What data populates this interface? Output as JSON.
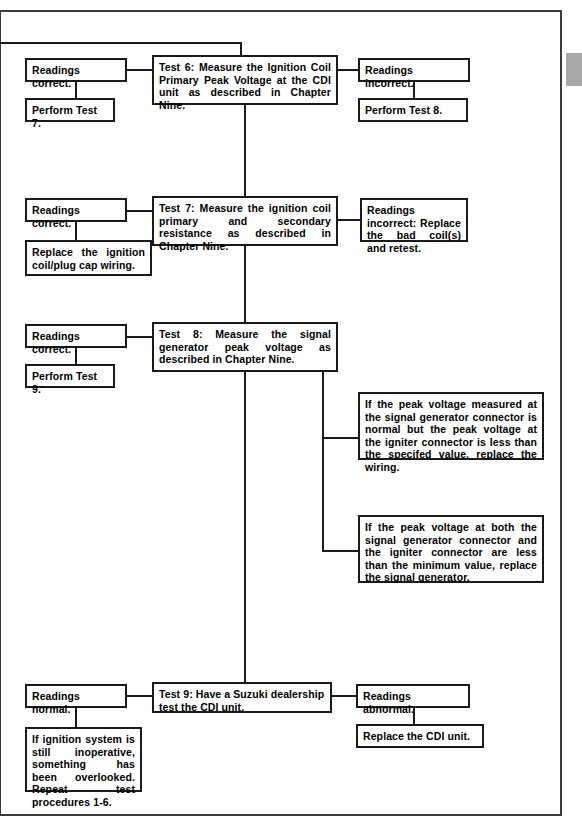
{
  "document": {
    "type": "flow-chart",
    "subject": "Ignition system troubleshooting, tests 6 through 9"
  },
  "nodes": {
    "test6": {
      "label": "Test 6: Measure the Ignition Coil Primary Peak Voltage at the CDI unit as described in Chapter Nine."
    },
    "test6_left_result": {
      "label": "Readings correct."
    },
    "test6_left_action": {
      "label": "Perform Test 7."
    },
    "test6_right_result": {
      "label": "Readings incorrect."
    },
    "test6_right_action": {
      "label": "Perform Test 8."
    },
    "test7": {
      "label": "Test 7: Measure the ignition coil primary and secondary resistance as described in Chapter Nine."
    },
    "test7_left_result": {
      "label": "Readings correct."
    },
    "test7_left_action": {
      "label": "Replace the ignition coil/plug cap wiring."
    },
    "test7_right_action": {
      "label": "Readings incorrect: Replace the bad coil(s) and retest."
    },
    "test8": {
      "label": "Test 8: Measure the signal generator peak voltage as described in Chapter Nine."
    },
    "test8_left_result": {
      "label": "Readings correct."
    },
    "test8_left_action": {
      "label": "Perform Test 9."
    },
    "test8_note_1": {
      "label": "If the peak voltage measured at the signal generator connector is normal but the peak voltage at the igniter connector is less than the specifed value, replace the wiring."
    },
    "test8_note_2": {
      "label": "If the peak voltage at both the signal generator connector and the igniter connector are less than the minimum value, replace the signal generator."
    },
    "test9": {
      "label": "Test 9: Have a Suzuki dealership test the CDI unit."
    },
    "test9_left_result": {
      "label": "Readings normal."
    },
    "test9_left_action": {
      "label": "If ignition system is still inoperative, something has been overlooked. Repeat test procedures 1-6."
    },
    "test9_right_result": {
      "label": "Readings abnormal."
    },
    "test9_right_action": {
      "label": "Replace the CDI unit."
    }
  },
  "colors": {
    "box_border": "#1a1a1a",
    "page_border": "#3a3a3a",
    "tab_marker": "#a8a8a8",
    "background": "#ffffff",
    "text": "#000000"
  }
}
